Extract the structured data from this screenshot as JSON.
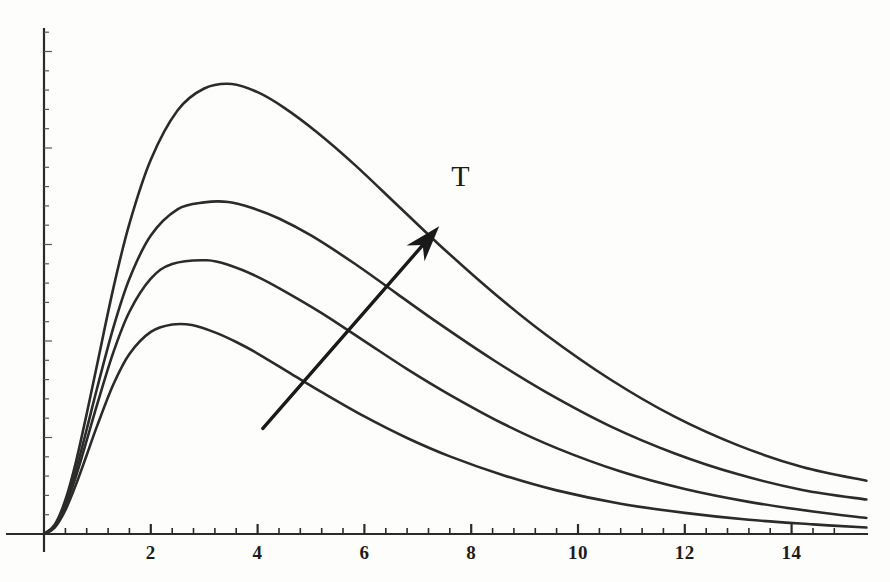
{
  "figure": {
    "background_color": "#fdfdfc",
    "ink_color": "#2b2b2b",
    "annotation_label": "T",
    "annotation_meaning": "temperature-increases-arrow"
  },
  "axes": {
    "x_labels": [
      "2",
      "4",
      "6",
      "8",
      "10",
      "12",
      "14"
    ],
    "x_label_values": [
      2,
      4,
      6,
      8,
      10,
      12,
      14
    ],
    "y_labels": [],
    "x_minor_ticks_per_major": 4,
    "grid": false
  },
  "chart_data": {
    "type": "line",
    "title": "",
    "xlabel": "",
    "ylabel": "",
    "xlim": [
      0,
      15.4
    ],
    "ylim": [
      0,
      1.08
    ],
    "grid": false,
    "legend": "none",
    "annotations": [
      {
        "text": "T",
        "x": 7.8,
        "y": 0.78,
        "type": "label"
      },
      {
        "type": "arrow",
        "x_start": 4.1,
        "y_start": 0.23,
        "x_end": 7.4,
        "y_end": 0.67,
        "meaning": "increasing temperature"
      }
    ],
    "series": [
      {
        "name": "curve-1-lowest-T",
        "peak_x": 2.77,
        "peak_y": 0.455,
        "x": [
          0,
          0.2,
          0.4,
          0.6,
          0.8,
          1.0,
          1.3,
          1.6,
          2.0,
          2.4,
          2.77,
          3.2,
          3.6,
          4.0,
          4.6,
          5.2,
          6.0,
          6.8,
          7.6,
          8.6,
          9.6,
          10.8,
          12.0,
          13.2,
          14.4,
          15.4
        ],
        "y": [
          0,
          0.014,
          0.052,
          0.108,
          0.172,
          0.237,
          0.326,
          0.392,
          0.44,
          0.456,
          0.455,
          0.439,
          0.418,
          0.393,
          0.351,
          0.309,
          0.256,
          0.209,
          0.169,
          0.128,
          0.095,
          0.066,
          0.046,
          0.031,
          0.021,
          0.014
        ]
      },
      {
        "name": "curve-2",
        "peak_x": 3.05,
        "peak_y": 0.596,
        "x": [
          0,
          0.2,
          0.4,
          0.6,
          0.8,
          1.0,
          1.3,
          1.6,
          2.0,
          2.4,
          3.05,
          3.5,
          4.0,
          4.5,
          5.2,
          6.0,
          6.8,
          7.6,
          8.6,
          9.6,
          10.8,
          12.0,
          13.2,
          14.4,
          15.4
        ],
        "y": [
          0,
          0.016,
          0.06,
          0.126,
          0.204,
          0.284,
          0.396,
          0.484,
          0.556,
          0.588,
          0.596,
          0.584,
          0.56,
          0.529,
          0.481,
          0.42,
          0.359,
          0.303,
          0.24,
          0.187,
          0.136,
          0.098,
          0.07,
          0.049,
          0.035
        ]
      },
      {
        "name": "curve-3",
        "peak_x": 3.45,
        "peak_y": 0.723,
        "x": [
          0,
          0.2,
          0.4,
          0.6,
          0.8,
          1.0,
          1.3,
          1.6,
          2.0,
          2.5,
          3.0,
          3.45,
          3.9,
          4.4,
          5.0,
          5.8,
          6.6,
          7.4,
          8.4,
          9.4,
          10.6,
          11.8,
          13.0,
          14.2,
          15.4
        ],
        "y": [
          0,
          0.018,
          0.066,
          0.14,
          0.228,
          0.32,
          0.45,
          0.556,
          0.65,
          0.707,
          0.722,
          0.723,
          0.71,
          0.687,
          0.65,
          0.59,
          0.524,
          0.458,
          0.38,
          0.309,
          0.235,
          0.176,
          0.13,
          0.096,
          0.075
        ]
      },
      {
        "name": "curve-4-highest-T",
        "peak_x": 3.52,
        "peak_y": 0.98,
        "x": [
          0,
          0.2,
          0.4,
          0.6,
          0.8,
          1.0,
          1.3,
          1.6,
          2.0,
          2.5,
          3.0,
          3.52,
          4.0,
          4.5,
          5.1,
          5.8,
          6.6,
          7.4,
          8.4,
          9.4,
          10.6,
          11.8,
          13.0,
          14.2,
          15.4
        ],
        "y": [
          0,
          0.02,
          0.074,
          0.158,
          0.262,
          0.372,
          0.536,
          0.676,
          0.815,
          0.922,
          0.97,
          0.98,
          0.962,
          0.928,
          0.876,
          0.806,
          0.718,
          0.63,
          0.527,
          0.434,
          0.337,
          0.256,
          0.193,
          0.146,
          0.116
        ]
      }
    ]
  }
}
